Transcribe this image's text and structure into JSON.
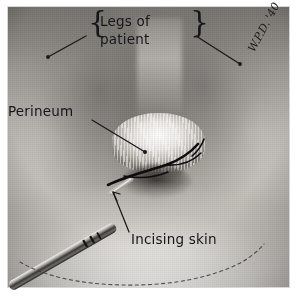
{
  "image": {
    "kind": "annotated-surgical-photograph",
    "medium": "black-and-white photographic print with handwritten ink annotations",
    "subject": "Episiotomy — incising the perineal skin",
    "background_color": "#ffffff",
    "plate_tone": "#b4b1ac",
    "ink_color": "#17171b"
  },
  "annotations": {
    "legs_label_line1": "Legs of",
    "legs_label_line2": "patient",
    "brace_left": "{",
    "brace_right": "}",
    "perineum_label": "Perineum",
    "incising_label": "Incising skin",
    "signature": "W.P.D. '40"
  },
  "features": [
    {
      "name": "left-leg",
      "label": "Legs of patient"
    },
    {
      "name": "right-leg",
      "label": "Legs of patient"
    },
    {
      "name": "perineum",
      "label": "Perineum"
    },
    {
      "name": "scalpel",
      "label": "scalpel incising skin"
    },
    {
      "name": "incision-line",
      "label": "Incising skin"
    },
    {
      "name": "drape-edge",
      "label": "dashed drape margin"
    }
  ],
  "leader_lines": {
    "legs_left_endpoint": "lower-left thigh",
    "legs_right_endpoint": "lower-right thigh",
    "perineum_endpoint": "central perineal body",
    "incising_arrow_endpoint": "blade tip at skin"
  }
}
